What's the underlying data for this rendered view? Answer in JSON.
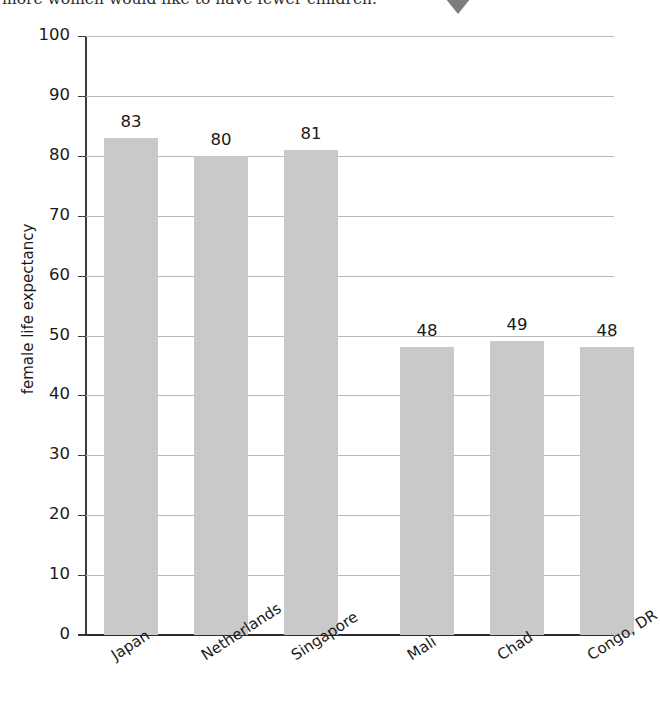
{
  "caption": {
    "text": "more women would like to have fewer children."
  },
  "marker": {
    "name": "down-triangle-marker",
    "color": "#7d7d7d"
  },
  "chart_data": {
    "type": "bar",
    "title": "",
    "xlabel": "",
    "ylabel": "female life expectancy",
    "categories": [
      "Japan",
      "Netherlands",
      "Singapore",
      "Mali",
      "Chad",
      "Congo, DR"
    ],
    "values": [
      83,
      80,
      81,
      48,
      49,
      48
    ],
    "value_labels": [
      "83",
      "80",
      "81",
      "48",
      "49",
      "48"
    ],
    "ylim": [
      0,
      100
    ],
    "yticks": [
      0,
      10,
      20,
      30,
      40,
      50,
      60,
      70,
      80,
      90,
      100
    ],
    "ytick_labels": [
      "0",
      "10",
      "20",
      "30",
      "40",
      "50",
      "60",
      "70",
      "80",
      "90",
      "100"
    ],
    "grid": true,
    "legend": "none",
    "bar_color": "#c9c9c9",
    "group_gap_after_index": 2
  }
}
